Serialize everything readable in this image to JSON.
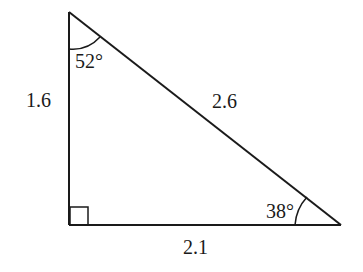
{
  "diagram": {
    "type": "right-triangle",
    "vertices": {
      "top": [
        69,
        12
      ],
      "right_angle": [
        69,
        225
      ],
      "right": [
        341,
        225
      ]
    },
    "sides": {
      "left": "1.6",
      "hypotenuse": "2.6",
      "bottom": "2.1"
    },
    "angles": {
      "top": "52°",
      "right": "38°",
      "right_angle_marker": true
    },
    "colors": {
      "stroke": "#1a1a1a",
      "background": "#ffffff"
    }
  }
}
